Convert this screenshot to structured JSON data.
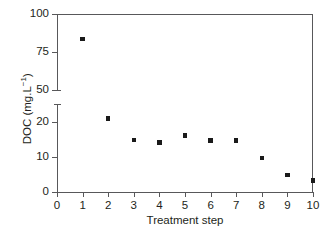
{
  "chart_data": {
    "type": "scatter",
    "title": "",
    "xlabel": "Treatment step",
    "ylabel": "DOC (mg.L−1)",
    "ylabel_base": "DOC (mg.L",
    "ylabel_exponent": "−1",
    "ylabel_tail": ")",
    "x": [
      1,
      2,
      3,
      4,
      5,
      6,
      7,
      8,
      9,
      10
    ],
    "values": [
      83.5,
      21.0,
      14.8,
      14.2,
      16.2,
      14.7,
      14.7,
      9.8,
      4.8,
      3.3
    ],
    "categories": [
      "1",
      "2",
      "3",
      "4",
      "5",
      "6",
      "7",
      "8",
      "9",
      "10"
    ],
    "xlim": [
      0,
      10
    ],
    "xticks": [
      0,
      1,
      2,
      3,
      4,
      5,
      6,
      7,
      8,
      9,
      10
    ],
    "xtick_labels": [
      "0",
      "1",
      "2",
      "3",
      "4",
      "5",
      "6",
      "7",
      "8",
      "9",
      "10"
    ],
    "broken_axis": true,
    "y_lower_range": [
      0,
      25
    ],
    "y_upper_range": [
      50,
      100
    ],
    "ytick_labels": [
      "0",
      "10",
      "20",
      "50",
      "75",
      "100"
    ],
    "yticks_lower": [
      0,
      10,
      20
    ],
    "yticks_upper": [
      50,
      75,
      100
    ],
    "grid": false,
    "legend": null,
    "marker_color": "#1a1a1a",
    "marker_shape": "square",
    "axis_color": "#58585a"
  }
}
